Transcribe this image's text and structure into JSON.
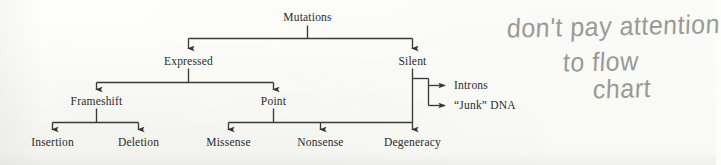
{
  "diagram": {
    "type": "tree-flowchart",
    "root": "Mutations",
    "nodes": {
      "mutations": "Mutations",
      "expressed": "Expressed",
      "silent": "Silent",
      "frameshift": "Frameshift",
      "point": "Point",
      "insertion": "Insertion",
      "deletion": "Deletion",
      "missense": "Missense",
      "nonsense": "Nonsense",
      "degeneracy": "Degeneracy",
      "introns": "Introns",
      "junk_dna": "“Junk” DNA"
    },
    "edges": [
      {
        "from": "Mutations",
        "to": "Expressed"
      },
      {
        "from": "Mutations",
        "to": "Silent"
      },
      {
        "from": "Expressed",
        "to": "Frameshift"
      },
      {
        "from": "Expressed",
        "to": "Point"
      },
      {
        "from": "Frameshift",
        "to": "Insertion"
      },
      {
        "from": "Frameshift",
        "to": "Deletion"
      },
      {
        "from": "Point",
        "to": "Missense"
      },
      {
        "from": "Point",
        "to": "Nonsense"
      },
      {
        "from": "Point",
        "to": "Degeneracy"
      },
      {
        "from": "Silent",
        "to": "Degeneracy"
      },
      {
        "from": "Silent",
        "to": "Introns"
      },
      {
        "from": "Silent",
        "to": "“Junk” DNA"
      }
    ],
    "ink_color": "#3a3a3a",
    "text_color": "#2b2b2b"
  },
  "annotation": {
    "line1": "don't pay attention",
    "line2": "to flow",
    "line3": "chart",
    "full_text": "don't pay attention to flow chart",
    "ink_color": "#9a9a96"
  },
  "page": {
    "background_color": "#fdfdfb"
  }
}
